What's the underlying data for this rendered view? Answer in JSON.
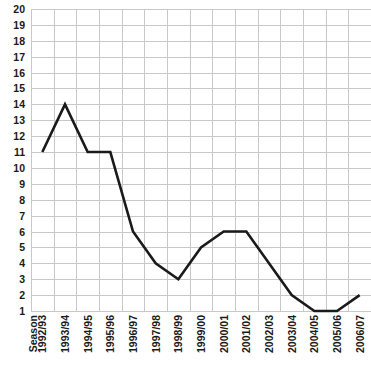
{
  "chart_data": {
    "type": "line",
    "title": "",
    "xlabel": "Season",
    "ylabel": "",
    "grid": true,
    "legend": "none",
    "ylim": [
      1,
      20
    ],
    "yticks": [
      1,
      2,
      3,
      4,
      5,
      6,
      7,
      8,
      9,
      10,
      11,
      12,
      13,
      14,
      15,
      16,
      17,
      18,
      19,
      20
    ],
    "axis_origin_label": "Season",
    "categories": [
      "1992/93",
      "1993/94",
      "1994/95",
      "1995/96",
      "1996/97",
      "1997/98",
      "1998/99",
      "1999/00",
      "2000/01",
      "2001/02",
      "2002/03",
      "2003/04",
      "2004/05",
      "2005/06",
      "2006/07"
    ],
    "values": [
      11,
      14,
      11,
      11,
      6,
      4,
      3,
      5,
      6,
      6,
      4,
      2,
      1,
      1,
      2
    ],
    "series": [
      {
        "name": "Position",
        "color": "#1a1a1a",
        "values": [
          11,
          14,
          11,
          11,
          6,
          4,
          3,
          5,
          6,
          6,
          4,
          2,
          1,
          1,
          2
        ]
      }
    ],
    "colors": {
      "line": "#1a1a1a",
      "grid": "#c8c8c8",
      "background": "#ffffff",
      "text": "#1a1a1a"
    }
  }
}
